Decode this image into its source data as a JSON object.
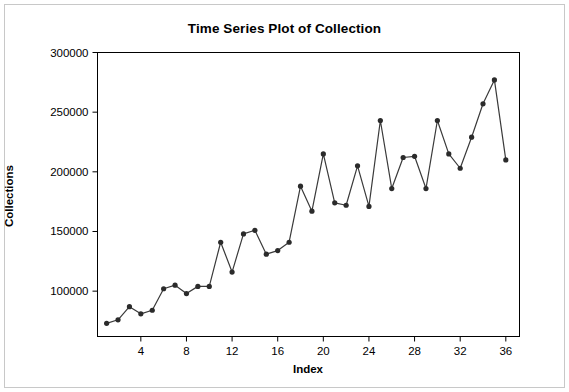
{
  "chart_data": {
    "type": "line",
    "title": "Time Series Plot of Collection",
    "xlabel": "Index",
    "ylabel": "Collections",
    "grid": false,
    "legend": null,
    "marker": "filled-circle",
    "line_color": "#3a3a3a",
    "marker_color": "#2b2b2b",
    "xlim": [
      0.2,
      37.2
    ],
    "ylim": [
      62000,
      300000
    ],
    "xticks": [
      4,
      8,
      12,
      16,
      20,
      24,
      28,
      32,
      36
    ],
    "yticks": [
      100000,
      150000,
      200000,
      250000,
      300000
    ],
    "ytick_labels": [
      "100000",
      "150000",
      "200000",
      "250000",
      "300000"
    ],
    "xtick_labels": [
      "4",
      "8",
      "12",
      "16",
      "20",
      "24",
      "28",
      "32",
      "36"
    ],
    "x": [
      1,
      2,
      3,
      4,
      5,
      6,
      7,
      8,
      9,
      10,
      11,
      12,
      13,
      14,
      15,
      16,
      17,
      18,
      19,
      20,
      21,
      22,
      23,
      24,
      25,
      26,
      27,
      28,
      29,
      30,
      31,
      32,
      33,
      34,
      35,
      36
    ],
    "values": [
      73000,
      76000,
      87000,
      81000,
      84000,
      102000,
      105000,
      98000,
      104000,
      104000,
      141000,
      116000,
      148000,
      151000,
      131000,
      134000,
      141000,
      188000,
      167000,
      215000,
      174000,
      172000,
      205000,
      171000,
      243000,
      186000,
      212000,
      213000,
      186000,
      243000,
      215000,
      203000,
      229000,
      257000,
      277000,
      210000
    ]
  },
  "axis": {
    "frame_color": "#000000"
  }
}
